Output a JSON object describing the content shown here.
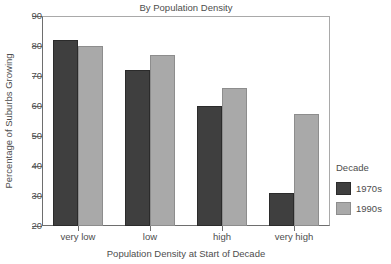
{
  "chart_data": {
    "type": "bar",
    "title": "By Population Density",
    "xlabel": "Population Density at Start of Decade",
    "ylabel": "Percentage of Suburbs Growing",
    "categories": [
      "very low",
      "low",
      "high",
      "very high"
    ],
    "series": [
      {
        "name": "1970s",
        "color": "#3f3f3f",
        "values": [
          82,
          72,
          60,
          31
        ]
      },
      {
        "name": "1990s",
        "color": "#a9a9a9",
        "values": [
          80,
          77,
          66,
          57.5
        ]
      }
    ],
    "ylim": [
      20,
      90
    ],
    "yticks": [
      20,
      30,
      40,
      50,
      60,
      70,
      80,
      90
    ],
    "ytick_labels": [
      "20",
      "30",
      "40",
      "50",
      "60",
      "70",
      "80",
      "90"
    ],
    "grid": false,
    "legend": {
      "title": "Decade",
      "position": "right",
      "entries": [
        "1970s",
        "1990s"
      ]
    }
  },
  "legend": {
    "title": "Decade",
    "items": [
      {
        "label": "1970s"
      },
      {
        "label": "1990s"
      }
    ]
  }
}
